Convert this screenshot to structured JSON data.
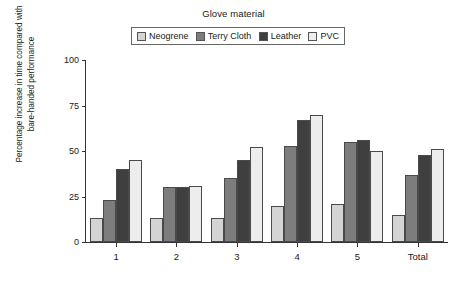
{
  "chart_data": {
    "type": "bar",
    "title": "",
    "legend_title": "Glove material",
    "legend_position": "top-center",
    "xlabel": "",
    "ylabel": "Percentage increase in time compared with bare-handed performance",
    "ylabel_lines": [
      "Percentage increase in time compared with",
      "bare-handed performance"
    ],
    "categories": [
      "1",
      "2",
      "3",
      "4",
      "5",
      "Total"
    ],
    "ylim": [
      0,
      100
    ],
    "yticks": [
      0,
      25,
      50,
      75,
      100
    ],
    "grid": false,
    "series": [
      {
        "name": "Neogrene",
        "color": "#d4d4d4",
        "values": [
          13,
          13,
          13,
          20,
          21,
          15
        ]
      },
      {
        "name": "Terry Cloth",
        "color": "#7d7d7d",
        "values": [
          23,
          30,
          35,
          53,
          55,
          37
        ]
      },
      {
        "name": "Leather",
        "color": "#3f3f3f",
        "values": [
          40,
          30,
          45,
          67,
          56,
          48
        ]
      },
      {
        "name": "PVC",
        "color": "#ededed",
        "values": [
          45,
          31,
          52,
          70,
          50,
          51
        ]
      }
    ]
  }
}
